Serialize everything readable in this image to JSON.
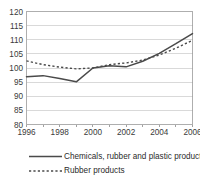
{
  "chart_data": {
    "type": "line",
    "title": "",
    "subtitle": "",
    "xlabel": "",
    "ylabel": "",
    "xlim": [
      1996,
      2006
    ],
    "ylim": [
      80,
      120
    ],
    "grid": true,
    "legend_position": "bottom-left",
    "y_ticks": [
      80,
      85,
      90,
      95,
      100,
      105,
      110,
      115,
      120
    ],
    "y_tick_labels": [
      "80",
      "85",
      "90",
      "95",
      "100",
      "105",
      "110",
      "115",
      "120"
    ],
    "x_ticks": [
      1996,
      1998,
      2000,
      2002,
      2004,
      2006
    ],
    "x_tick_labels": [
      "1996",
      "1998",
      "2000",
      "2002",
      "2004",
      "2006"
    ],
    "x": [
      1996,
      1997,
      1998,
      1999,
      2000,
      2001,
      2002,
      2003,
      2004,
      2005,
      2006
    ],
    "series": [
      {
        "name": "Chemicals, rubber and plastic products",
        "style": "solid",
        "color": "#4a4a4a",
        "values": [
          96.9,
          97.3,
          96.3,
          95.1,
          100.0,
          100.8,
          100.4,
          102.4,
          105.2,
          108.6,
          112.2
        ]
      },
      {
        "name": "Rubber products",
        "style": "dashed",
        "color": "#4a4a4a",
        "values": [
          102.5,
          101.2,
          100.3,
          99.7,
          100.0,
          101.2,
          101.8,
          102.8,
          104.6,
          107.0,
          109.8
        ]
      }
    ],
    "legend": [
      {
        "label": "Chemicals, rubber and plastic products",
        "style": "solid"
      },
      {
        "label": "Rubber products",
        "style": "dashed"
      }
    ]
  }
}
